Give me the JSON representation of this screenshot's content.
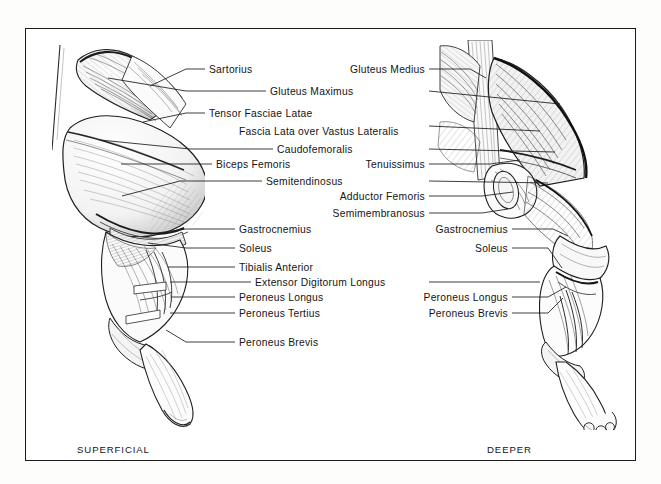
{
  "plate": {
    "title": "Canine hind limb musculature",
    "background_color": "#ffffff",
    "frame_color": "#1a1a1a",
    "ink_color": "#141414"
  },
  "captions": {
    "left": "SUPERFICIAL",
    "right": "DEEPER"
  },
  "left_figure": {
    "name": "superficial-hindlimb-figure",
    "labels": [
      {
        "text": "Sartorius",
        "x": 209,
        "y": 64,
        "align": "left",
        "leader": [
          [
            205,
            69
          ],
          [
            186,
            69
          ],
          [
            150,
            86
          ]
        ]
      },
      {
        "text": "Gluteus Maximus",
        "x": 270,
        "y": 86,
        "align": "left",
        "leader": [
          [
            266,
            91
          ],
          [
            186,
            91
          ],
          [
            108,
            78
          ]
        ]
      },
      {
        "text": "Tensor Fasciae Latae",
        "x": 209,
        "y": 108,
        "align": "left",
        "leader": [
          [
            205,
            113
          ],
          [
            186,
            113
          ],
          [
            143,
            122
          ]
        ]
      },
      {
        "text": "Fascia Lata over Vastus Lateralis",
        "x": 239,
        "y": 126,
        "align": "left",
        "leader": null
      },
      {
        "text": "Caudofemoralis",
        "x": 277,
        "y": 144,
        "align": "left",
        "leader": [
          [
            273,
            149
          ],
          [
            190,
            149
          ],
          [
            100,
            140
          ]
        ]
      },
      {
        "text": "Biceps Femoris",
        "x": 216,
        "y": 159,
        "align": "left",
        "leader": [
          [
            212,
            164
          ],
          [
            186,
            164
          ],
          [
            121,
            164
          ]
        ]
      },
      {
        "text": "Semitendinosus",
        "x": 266,
        "y": 176,
        "align": "left",
        "leader": [
          [
            262,
            181
          ],
          [
            180,
            181
          ],
          [
            122,
            196
          ]
        ]
      },
      {
        "text": "Gastrocnemius",
        "x": 239,
        "y": 224,
        "align": "left",
        "leader": [
          [
            235,
            229
          ],
          [
            186,
            229
          ],
          [
            150,
            234
          ]
        ]
      },
      {
        "text": "Soleus",
        "x": 239,
        "y": 243,
        "align": "left",
        "leader": [
          [
            235,
            248
          ],
          [
            186,
            248
          ],
          [
            148,
            243
          ]
        ]
      },
      {
        "text": "Tibialis Anterior",
        "x": 239,
        "y": 262,
        "align": "left",
        "leader": [
          [
            235,
            267
          ],
          [
            186,
            267
          ],
          [
            168,
            267
          ]
        ]
      },
      {
        "text": "Extensor Digitorum Longus",
        "x": 255,
        "y": 277,
        "align": "left",
        "leader": [
          [
            251,
            282
          ],
          [
            186,
            282
          ],
          [
            170,
            282
          ]
        ]
      },
      {
        "text": "Peroneus Longus",
        "x": 239,
        "y": 292,
        "align": "left",
        "leader": [
          [
            235,
            297
          ],
          [
            186,
            297
          ],
          [
            172,
            297
          ]
        ]
      },
      {
        "text": "Peroneus Tertius",
        "x": 239,
        "y": 308,
        "align": "left",
        "leader": [
          [
            235,
            313
          ],
          [
            186,
            313
          ],
          [
            170,
            313
          ]
        ]
      },
      {
        "text": "Peroneus Brevis",
        "x": 239,
        "y": 337,
        "align": "left",
        "leader": [
          [
            235,
            342
          ],
          [
            186,
            342
          ],
          [
            166,
            330
          ]
        ]
      }
    ]
  },
  "right_figure": {
    "name": "deeper-hindlimb-figure",
    "labels": [
      {
        "text": "Gluteus Medius",
        "x": 425,
        "y": 64,
        "align": "right",
        "leader": [
          [
            429,
            69
          ],
          [
            470,
            69
          ],
          [
            486,
            78
          ]
        ]
      },
      {
        "text": "Tenuissimus",
        "x": 425,
        "y": 159,
        "align": "right",
        "leader": [
          [
            429,
            164
          ],
          [
            490,
            164
          ],
          [
            520,
            160
          ]
        ]
      },
      {
        "text": "Adductor Femoris",
        "x": 425,
        "y": 191,
        "align": "right",
        "leader": [
          [
            429,
            196
          ],
          [
            482,
            196
          ],
          [
            513,
            192
          ]
        ]
      },
      {
        "text": "Semimembranosus",
        "x": 425,
        "y": 208,
        "align": "right",
        "leader": [
          [
            429,
            213
          ],
          [
            482,
            213
          ],
          [
            508,
            209
          ]
        ]
      },
      {
        "text": "Gastrocnemius",
        "x": 508,
        "y": 224,
        "align": "right",
        "leader": [
          [
            512,
            229
          ],
          [
            553,
            229
          ],
          [
            568,
            236
          ]
        ]
      },
      {
        "text": "Soleus",
        "x": 508,
        "y": 243,
        "align": "right",
        "leader": [
          [
            512,
            248
          ],
          [
            548,
            248
          ],
          [
            562,
            268
          ]
        ]
      },
      {
        "text": "Peroneus Longus",
        "x": 508,
        "y": 292,
        "align": "right",
        "leader": [
          [
            512,
            297
          ],
          [
            548,
            297
          ],
          [
            566,
            287
          ]
        ]
      },
      {
        "text": "Peroneus Brevis",
        "x": 508,
        "y": 308,
        "align": "right",
        "leader": [
          [
            512,
            313
          ],
          [
            548,
            313
          ],
          [
            563,
            298
          ]
        ]
      }
    ]
  },
  "cross_leaders": [
    {
      "from": [
        429,
        91
      ],
      "to": [
        560,
        104
      ],
      "name": "gluteus-maximus-right-leader"
    },
    {
      "from": [
        429,
        126
      ],
      "to": [
        540,
        131
      ],
      "name": "fascia-lata-right-leader"
    },
    {
      "from": [
        429,
        149
      ],
      "to": [
        555,
        152
      ],
      "name": "caudofemoralis-right-leader"
    },
    {
      "from": [
        429,
        181
      ],
      "to": [
        548,
        183
      ],
      "name": "semitendinosus-right-leader"
    },
    {
      "from": [
        429,
        282
      ],
      "to": [
        540,
        282
      ],
      "name": "extensor-digitorum-longus-right-leader"
    }
  ]
}
